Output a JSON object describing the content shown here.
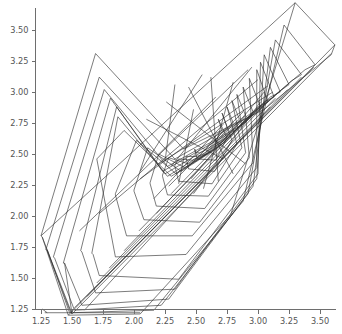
{
  "chart_data": {
    "type": "line",
    "title": "",
    "subtitle": "",
    "xlabel": "",
    "ylabel": "",
    "xlim": [
      1.13,
      3.78
    ],
    "ylim": [
      1.15,
      3.82
    ],
    "grid": false,
    "legend": null,
    "annotations": [],
    "x_ticks": [
      1.25,
      1.5,
      1.75,
      2.0,
      2.25,
      2.5,
      2.75,
      3.0,
      3.25,
      3.5
    ],
    "x_ticklabels": [
      "1.25",
      "1.50",
      "1.75",
      "2.00",
      "2.25",
      "2.50",
      "2.75",
      "3.00",
      "3.25",
      "3.50"
    ],
    "y_ticks": [
      1.25,
      1.5,
      1.75,
      2.0,
      2.25,
      2.5,
      2.75,
      3.0,
      3.25,
      3.5
    ],
    "y_ticklabels": [
      "1.25",
      "1.50",
      "1.75",
      "2.00",
      "2.25",
      "2.50",
      "2.75",
      "3.00",
      "3.25",
      "3.50"
    ],
    "series": [
      {
        "name": "hull-1",
        "closed": true,
        "x": [
          1.26,
          1.47,
          2.05,
          2.78,
          3.3,
          3.62,
          3.59,
          3.05,
          2.4,
          1.69,
          1.25
        ],
        "y": [
          1.83,
          1.2,
          1.21,
          2.01,
          3.72,
          3.38,
          3.3,
          2.86,
          2.54,
          3.31,
          1.84
        ]
      },
      {
        "name": "hull-2",
        "closed": true,
        "x": [
          1.3,
          1.49,
          2.16,
          2.88,
          3.21,
          3.46,
          3.38,
          2.93,
          2.33,
          1.72,
          1.29
        ],
        "y": [
          1.72,
          1.22,
          1.24,
          2.12,
          3.54,
          3.22,
          3.18,
          2.8,
          2.46,
          3.12,
          1.73
        ]
      },
      {
        "name": "hull-3",
        "closed": true,
        "x": [
          1.36,
          1.52,
          2.22,
          2.92,
          3.14,
          3.35,
          3.27,
          2.88,
          2.27,
          1.76,
          1.35
        ],
        "y": [
          1.66,
          1.24,
          1.28,
          2.18,
          3.42,
          3.14,
          3.09,
          2.74,
          2.4,
          3.02,
          1.67
        ]
      },
      {
        "name": "hull-4",
        "closed": true,
        "x": [
          1.44,
          1.58,
          2.28,
          2.96,
          3.1,
          3.25,
          3.18,
          2.83,
          2.23,
          1.81,
          1.43
        ],
        "y": [
          1.62,
          1.28,
          1.33,
          2.24,
          3.36,
          3.06,
          3.01,
          2.7,
          2.36,
          2.95,
          1.62
        ]
      },
      {
        "name": "hull-5",
        "closed": true,
        "x": [
          1.58,
          1.69,
          2.33,
          2.99,
          3.05,
          3.18,
          3.1,
          2.79,
          2.25,
          1.86,
          1.57
        ],
        "y": [
          1.71,
          1.38,
          1.41,
          2.3,
          3.3,
          3.0,
          2.96,
          2.66,
          2.34,
          2.88,
          1.72
        ]
      },
      {
        "name": "hull-6",
        "closed": true,
        "x": [
          1.67,
          1.72,
          2.36,
          3.0,
          3.02,
          3.13,
          3.05,
          2.76,
          2.27,
          1.87,
          1.66
        ],
        "y": [
          1.69,
          1.52,
          1.49,
          2.34,
          3.24,
          2.96,
          2.92,
          2.63,
          2.32,
          2.8,
          1.7
        ]
      },
      {
        "name": "hull-7",
        "closed": true,
        "x": [
          1.7,
          1.85,
          2.42,
          2.99,
          2.99,
          3.08,
          3.0,
          2.74,
          2.3,
          1.92,
          1.7
        ],
        "y": [
          2.46,
          1.67,
          1.69,
          2.39,
          3.18,
          2.92,
          2.88,
          2.6,
          2.32,
          2.69,
          2.46
        ]
      },
      {
        "name": "hull-8",
        "closed": true,
        "x": [
          1.85,
          1.94,
          2.47,
          2.96,
          2.93,
          3.02,
          2.95,
          2.7,
          2.34,
          2.02,
          1.85
        ],
        "y": [
          2.17,
          1.84,
          1.84,
          2.43,
          3.11,
          2.88,
          2.83,
          2.57,
          2.34,
          2.61,
          2.18
        ]
      },
      {
        "name": "hull-9",
        "closed": true,
        "x": [
          2.0,
          2.08,
          2.53,
          2.93,
          2.88,
          2.96,
          2.89,
          2.66,
          2.38,
          2.11,
          2.0
        ],
        "y": [
          2.2,
          1.97,
          1.95,
          2.47,
          3.04,
          2.84,
          2.79,
          2.54,
          2.36,
          2.55,
          2.21
        ]
      },
      {
        "name": "hull-10",
        "closed": true,
        "x": [
          2.13,
          2.18,
          2.57,
          2.9,
          2.83,
          2.9,
          2.84,
          2.62,
          2.41,
          2.2,
          2.13
        ],
        "y": [
          2.26,
          2.08,
          2.06,
          2.51,
          2.98,
          2.81,
          2.76,
          2.52,
          2.39,
          2.5,
          2.27
        ]
      },
      {
        "name": "hull-11",
        "closed": true,
        "x": [
          2.23,
          2.27,
          2.6,
          2.87,
          2.79,
          2.85,
          2.79,
          2.6,
          2.44,
          2.28,
          2.23
        ],
        "y": [
          2.32,
          2.17,
          2.16,
          2.55,
          2.93,
          2.78,
          2.73,
          2.51,
          2.42,
          2.47,
          2.33
        ]
      },
      {
        "name": "hull-12",
        "closed": true,
        "x": [
          2.33,
          2.36,
          2.63,
          2.83,
          2.75,
          2.8,
          2.75,
          2.58,
          2.47,
          2.36,
          2.33
        ],
        "y": [
          2.4,
          2.28,
          2.26,
          2.58,
          2.88,
          2.75,
          2.7,
          2.5,
          2.45,
          2.46,
          2.41
        ]
      },
      {
        "name": "hull-13",
        "closed": true,
        "x": [
          2.42,
          2.44,
          2.65,
          2.79,
          2.71,
          2.75,
          2.71,
          2.57,
          2.5,
          2.44,
          2.42
        ],
        "y": [
          2.47,
          2.38,
          2.36,
          2.61,
          2.83,
          2.72,
          2.68,
          2.5,
          2.48,
          2.48,
          2.48
        ]
      },
      {
        "name": "hull-14",
        "closed": true,
        "x": [
          2.49,
          2.51,
          2.66,
          2.75,
          2.68,
          2.71,
          2.67,
          2.57,
          2.53,
          2.5,
          2.49
        ],
        "y": [
          2.53,
          2.46,
          2.45,
          2.63,
          2.78,
          2.69,
          2.66,
          2.53,
          2.51,
          2.51,
          2.54
        ]
      },
      {
        "name": "chord-1",
        "closed": false,
        "x": [
          1.25,
          3.3
        ],
        "y": [
          1.84,
          3.72
        ]
      },
      {
        "name": "chord-2",
        "closed": false,
        "x": [
          1.47,
          3.62
        ],
        "y": [
          1.2,
          3.38
        ]
      },
      {
        "name": "chord-3",
        "closed": false,
        "x": [
          1.5,
          3.59
        ],
        "y": [
          1.21,
          3.31
        ]
      },
      {
        "name": "chord-4",
        "closed": false,
        "x": [
          1.26,
          1.5
        ],
        "y": [
          1.83,
          1.21
        ]
      },
      {
        "name": "chord-5",
        "closed": false,
        "x": [
          1.28,
          2.05
        ],
        "y": [
          1.22,
          1.22
        ]
      },
      {
        "name": "chord-6",
        "closed": false,
        "x": [
          1.52,
          3.45
        ],
        "y": [
          1.26,
          3.2
        ]
      },
      {
        "name": "chord-7",
        "closed": false,
        "x": [
          1.62,
          3.35
        ],
        "y": [
          1.35,
          3.12
        ]
      },
      {
        "name": "chord-8",
        "closed": false,
        "x": [
          1.7,
          3.24
        ],
        "y": [
          1.46,
          3.02
        ]
      },
      {
        "name": "chord-9",
        "closed": false,
        "x": [
          1.8,
          3.14
        ],
        "y": [
          1.58,
          2.95
        ]
      },
      {
        "name": "chord-10",
        "closed": false,
        "x": [
          1.92,
          3.04
        ],
        "y": [
          1.72,
          2.88
        ]
      },
      {
        "name": "chord-11",
        "closed": false,
        "x": [
          2.04,
          2.96
        ],
        "y": [
          1.88,
          2.82
        ]
      },
      {
        "name": "chord-12",
        "closed": false,
        "x": [
          2.18,
          2.9
        ],
        "y": [
          2.02,
          2.78
        ]
      },
      {
        "name": "chord-13",
        "closed": false,
        "x": [
          2.3,
          2.84
        ],
        "y": [
          2.18,
          2.74
        ]
      },
      {
        "name": "chord-14",
        "closed": false,
        "x": [
          1.56,
          2.92
        ],
        "y": [
          1.88,
          3.18
        ]
      },
      {
        "name": "chord-15",
        "closed": false,
        "x": [
          1.72,
          3.0
        ],
        "y": [
          2.02,
          3.1
        ]
      },
      {
        "name": "chord-16",
        "closed": false,
        "x": [
          2.05,
          3.08
        ],
        "y": [
          2.3,
          3.05
        ]
      },
      {
        "name": "chord-17",
        "closed": false,
        "x": [
          2.2,
          3.12
        ],
        "y": [
          2.42,
          3.0
        ]
      },
      {
        "name": "chord-18",
        "closed": false,
        "x": [
          2.33,
          2.25
        ],
        "y": [
          3.06,
          2.44
        ]
      },
      {
        "name": "chord-19",
        "closed": false,
        "x": [
          2.55,
          2.05
        ],
        "y": [
          3.14,
          2.36
        ]
      },
      {
        "name": "chord-20",
        "closed": false,
        "x": [
          2.95,
          2.3
        ],
        "y": [
          3.2,
          2.4
        ]
      },
      {
        "name": "chord-21",
        "closed": false,
        "x": [
          3.05,
          2.46
        ],
        "y": [
          3.0,
          2.3
        ]
      },
      {
        "name": "chord-22",
        "closed": false,
        "x": [
          2.88,
          2.28
        ],
        "y": [
          2.84,
          2.24
        ]
      },
      {
        "name": "chord-23",
        "closed": false,
        "x": [
          2.72,
          2.16
        ],
        "y": [
          2.74,
          2.14
        ]
      },
      {
        "name": "chord-24",
        "closed": false,
        "x": [
          3.02,
          2.48
        ],
        "y": [
          2.92,
          2.18
        ]
      },
      {
        "name": "chord-25",
        "closed": false,
        "x": [
          2.8,
          2.56
        ],
        "y": [
          3.08,
          2.22
        ]
      },
      {
        "name": "chord-26",
        "closed": false,
        "x": [
          2.62,
          2.68
        ],
        "y": [
          3.12,
          2.28
        ]
      },
      {
        "name": "chord-27",
        "closed": false,
        "x": [
          2.44,
          2.8
        ],
        "y": [
          3.04,
          2.34
        ]
      },
      {
        "name": "chord-28",
        "closed": false,
        "x": [
          2.26,
          2.9
        ],
        "y": [
          2.92,
          2.42
        ]
      },
      {
        "name": "chord-29",
        "closed": false,
        "x": [
          2.1,
          2.72
        ],
        "y": [
          2.78,
          2.46
        ]
      },
      {
        "name": "chord-30",
        "closed": false,
        "x": [
          2.48,
          2.36
        ],
        "y": [
          2.86,
          2.26
        ]
      },
      {
        "name": "chord-31",
        "closed": false,
        "x": [
          2.66,
          2.2
        ],
        "y": [
          2.96,
          2.5
        ]
      },
      {
        "name": "chord-32",
        "closed": false,
        "x": [
          1.44,
          1.5
        ],
        "y": [
          1.62,
          1.21
        ]
      },
      {
        "name": "chord-33",
        "closed": false,
        "x": [
          1.3,
          1.48
        ],
        "y": [
          1.73,
          1.22
        ]
      },
      {
        "name": "chord-34",
        "closed": false,
        "x": [
          1.6,
          3.1
        ],
        "y": [
          1.24,
          2.88
        ]
      },
      {
        "name": "chord-35",
        "closed": false,
        "x": [
          1.26,
          1.3
        ],
        "y": [
          1.25,
          1.22
        ]
      }
    ]
  },
  "axes": {
    "x_axis_name": "x-axis",
    "y_axis_name": "y-axis"
  }
}
